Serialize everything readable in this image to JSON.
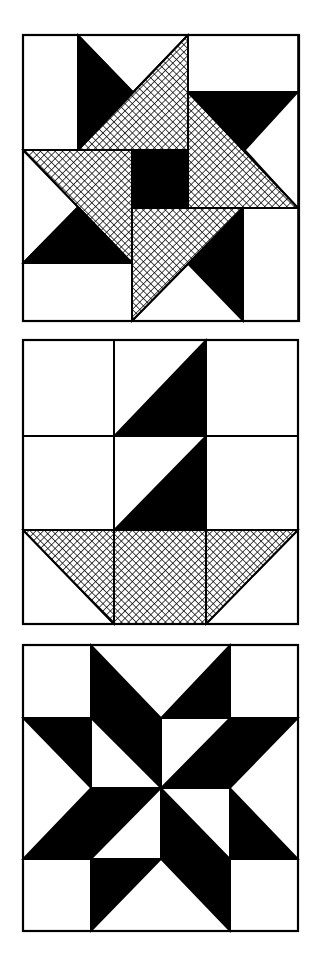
{
  "colors": {
    "background": "#ffffff",
    "ink": "#000000",
    "hatch_bg": "#ffffff"
  },
  "hatch": {
    "spacing": 5.2,
    "stroke_width": 1.4
  },
  "border_width": 2.2,
  "blocks": [
    {
      "name": "pinwheel-star-block",
      "label": "Pinwheel star with hatched arms and black center",
      "bounds": [
        23,
        35,
        299,
        321
      ],
      "pieces": [
        {
          "fill": "white",
          "pts": [
            [
              23,
              35
            ],
            [
              78,
              35
            ],
            [
              78,
              150
            ],
            [
              23,
              150
            ]
          ]
        },
        {
          "fill": "white",
          "pts": [
            [
              78,
              35
            ],
            [
              188,
              35
            ],
            [
              133,
              92
            ]
          ]
        },
        {
          "fill": "black",
          "pts": [
            [
              78,
              35
            ],
            [
              133,
              92
            ],
            [
              78,
              150
            ]
          ]
        },
        {
          "fill": "hatch",
          "pts": [
            [
              78,
              150
            ],
            [
              188,
              35
            ],
            [
              188,
              150
            ]
          ]
        },
        {
          "fill": "white",
          "pts": [
            [
              188,
              35
            ],
            [
              298,
              35
            ],
            [
              298,
              92
            ],
            [
              188,
              92
            ]
          ]
        },
        {
          "fill": "black",
          "pts": [
            [
              188,
              92
            ],
            [
              298,
              92
            ],
            [
              245,
              150
            ]
          ]
        },
        {
          "fill": "white",
          "pts": [
            [
              298,
              92
            ],
            [
              298,
              208
            ],
            [
              245,
              150
            ]
          ]
        },
        {
          "fill": "hatch",
          "pts": [
            [
              188,
              92
            ],
            [
              298,
              208
            ],
            [
              188,
              208
            ]
          ]
        },
        {
          "fill": "black",
          "pts": [
            [
              132,
              150
            ],
            [
              188,
              150
            ],
            [
              188,
              208
            ],
            [
              132,
              208
            ]
          ]
        },
        {
          "fill": "hatch",
          "pts": [
            [
              23,
              150
            ],
            [
              132,
              150
            ],
            [
              132,
              263
            ]
          ]
        },
        {
          "fill": "white",
          "pts": [
            [
              23,
              150
            ],
            [
              78,
              207
            ],
            [
              23,
              263
            ]
          ]
        },
        {
          "fill": "black",
          "pts": [
            [
              23,
              263
            ],
            [
              78,
              207
            ],
            [
              132,
              263
            ]
          ]
        },
        {
          "fill": "white",
          "pts": [
            [
              23,
              263
            ],
            [
              132,
              263
            ],
            [
              132,
              321
            ],
            [
              23,
              321
            ]
          ]
        },
        {
          "fill": "hatch",
          "pts": [
            [
              132,
              208
            ],
            [
              243,
              208
            ],
            [
              132,
              321
            ]
          ]
        },
        {
          "fill": "black",
          "pts": [
            [
              243,
              208
            ],
            [
              243,
              321
            ],
            [
              188,
              264
            ]
          ]
        },
        {
          "fill": "white",
          "pts": [
            [
              132,
              321
            ],
            [
              188,
              264
            ],
            [
              243,
              321
            ]
          ]
        },
        {
          "fill": "white",
          "pts": [
            [
              243,
              208
            ],
            [
              298,
              208
            ],
            [
              298,
              321
            ],
            [
              243,
              321
            ]
          ]
        }
      ],
      "lines": [
        [
          [
            78,
            35
          ],
          [
            78,
            150
          ]
        ],
        [
          [
            188,
            35
          ],
          [
            188,
            208
          ]
        ],
        [
          [
            188,
            92
          ],
          [
            298,
            92
          ]
        ],
        [
          [
            23,
            150
          ],
          [
            188,
            150
          ]
        ],
        [
          [
            132,
            150
          ],
          [
            132,
            321
          ]
        ],
        [
          [
            132,
            208
          ],
          [
            298,
            208
          ]
        ],
        [
          [
            243,
            208
          ],
          [
            243,
            321
          ]
        ],
        [
          [
            23,
            263
          ],
          [
            132,
            263
          ]
        ],
        [
          [
            78,
            150
          ],
          [
            188,
            35
          ]
        ],
        [
          [
            188,
            92
          ],
          [
            298,
            208
          ]
        ],
        [
          [
            23,
            150
          ],
          [
            132,
            263
          ]
        ],
        [
          [
            132,
            321
          ],
          [
            243,
            208
          ]
        ]
      ]
    },
    {
      "name": "sailboat-basket-block",
      "label": "Nine-patch with two black sail triangles and hatched basket",
      "bounds": [
        23,
        340,
        298,
        624
      ],
      "pieces": [
        {
          "fill": "black",
          "pts": [
            [
              114,
              436
            ],
            [
              206,
              340
            ],
            [
              206,
              436
            ]
          ]
        },
        {
          "fill": "black",
          "pts": [
            [
              114,
              530
            ],
            [
              206,
              436
            ],
            [
              206,
              530
            ]
          ]
        },
        {
          "fill": "hatch",
          "pts": [
            [
              23,
              530
            ],
            [
              114,
              530
            ],
            [
              114,
              624
            ]
          ]
        },
        {
          "fill": "hatch",
          "pts": [
            [
              114,
              530
            ],
            [
              206,
              530
            ],
            [
              206,
              624
            ],
            [
              114,
              624
            ]
          ]
        },
        {
          "fill": "hatch",
          "pts": [
            [
              206,
              530
            ],
            [
              298,
              530
            ],
            [
              206,
              624
            ]
          ]
        }
      ],
      "lines": [
        [
          [
            114,
            340
          ],
          [
            114,
            624
          ]
        ],
        [
          [
            206,
            340
          ],
          [
            206,
            624
          ]
        ],
        [
          [
            23,
            436
          ],
          [
            298,
            436
          ]
        ],
        [
          [
            23,
            530
          ],
          [
            298,
            530
          ]
        ],
        [
          [
            23,
            530
          ],
          [
            114,
            624
          ]
        ],
        [
          [
            298,
            530
          ],
          [
            206,
            624
          ]
        ]
      ]
    },
    {
      "name": "eight-point-star-block",
      "label": "Black eight-pointed star on 4x4 grid",
      "bounds": [
        23,
        645,
        298,
        931
      ],
      "pieces": [
        {
          "fill": "black",
          "pts": [
            [
              91,
              645
            ],
            [
              161,
              718
            ],
            [
              91,
              718
            ]
          ]
        },
        {
          "fill": "black",
          "pts": [
            [
              230,
              645
            ],
            [
              230,
              718
            ],
            [
              161,
              718
            ]
          ]
        },
        {
          "fill": "black",
          "pts": [
            [
              23,
              718
            ],
            [
              91,
              718
            ],
            [
              91,
              788
            ]
          ]
        },
        {
          "fill": "black",
          "pts": [
            [
              91,
              718
            ],
            [
              161,
              718
            ],
            [
              161,
              788
            ]
          ]
        },
        {
          "fill": "black",
          "pts": [
            [
              230,
              718
            ],
            [
              230,
              788
            ],
            [
              161,
              788
            ]
          ]
        },
        {
          "fill": "black",
          "pts": [
            [
              230,
              718
            ],
            [
              298,
              718
            ],
            [
              230,
              788
            ]
          ]
        },
        {
          "fill": "black",
          "pts": [
            [
              91,
              788
            ],
            [
              91,
              859
            ],
            [
              23,
              859
            ]
          ]
        },
        {
          "fill": "black",
          "pts": [
            [
              91,
              788
            ],
            [
              161,
              788
            ],
            [
              91,
              859
            ]
          ]
        },
        {
          "fill": "black",
          "pts": [
            [
              161,
              788
            ],
            [
              230,
              859
            ],
            [
              161,
              859
            ]
          ]
        },
        {
          "fill": "black",
          "pts": [
            [
              230,
              788
            ],
            [
              298,
              859
            ],
            [
              230,
              859
            ]
          ]
        },
        {
          "fill": "black",
          "pts": [
            [
              91,
              859
            ],
            [
              161,
              859
            ],
            [
              91,
              931
            ]
          ]
        },
        {
          "fill": "black",
          "pts": [
            [
              161,
              859
            ],
            [
              230,
              859
            ],
            [
              230,
              931
            ]
          ]
        }
      ],
      "lines": [
        [
          [
            91,
            645
          ],
          [
            91,
            931
          ]
        ],
        [
          [
            161,
            718
          ],
          [
            161,
            859
          ]
        ],
        [
          [
            230,
            645
          ],
          [
            230,
            931
          ]
        ],
        [
          [
            23,
            718
          ],
          [
            298,
            718
          ]
        ],
        [
          [
            91,
            788
          ],
          [
            230,
            788
          ]
        ],
        [
          [
            23,
            859
          ],
          [
            298,
            859
          ]
        ]
      ]
    }
  ]
}
